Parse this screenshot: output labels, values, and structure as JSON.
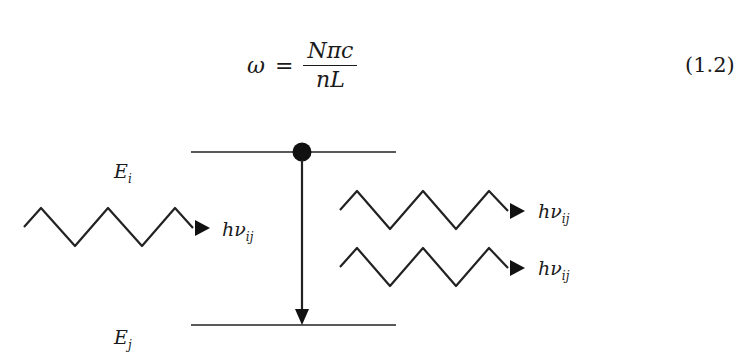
{
  "equation": {
    "lhs": "ω",
    "operator": "=",
    "numerator": "Nπc",
    "denominator": "nL",
    "number": "(1.2)"
  },
  "diagram": {
    "upper_level": {
      "label": "E",
      "subscript": "i"
    },
    "lower_level": {
      "label": "E",
      "subscript": "j"
    },
    "incident_photon": {
      "label": "hν",
      "subscript": "ij"
    },
    "emitted_photons": [
      {
        "label": "hν",
        "subscript": "ij"
      },
      {
        "label": "hν",
        "subscript": "ij"
      }
    ],
    "transition": "stimulated emission (downward arrow from E_i to E_j)"
  }
}
